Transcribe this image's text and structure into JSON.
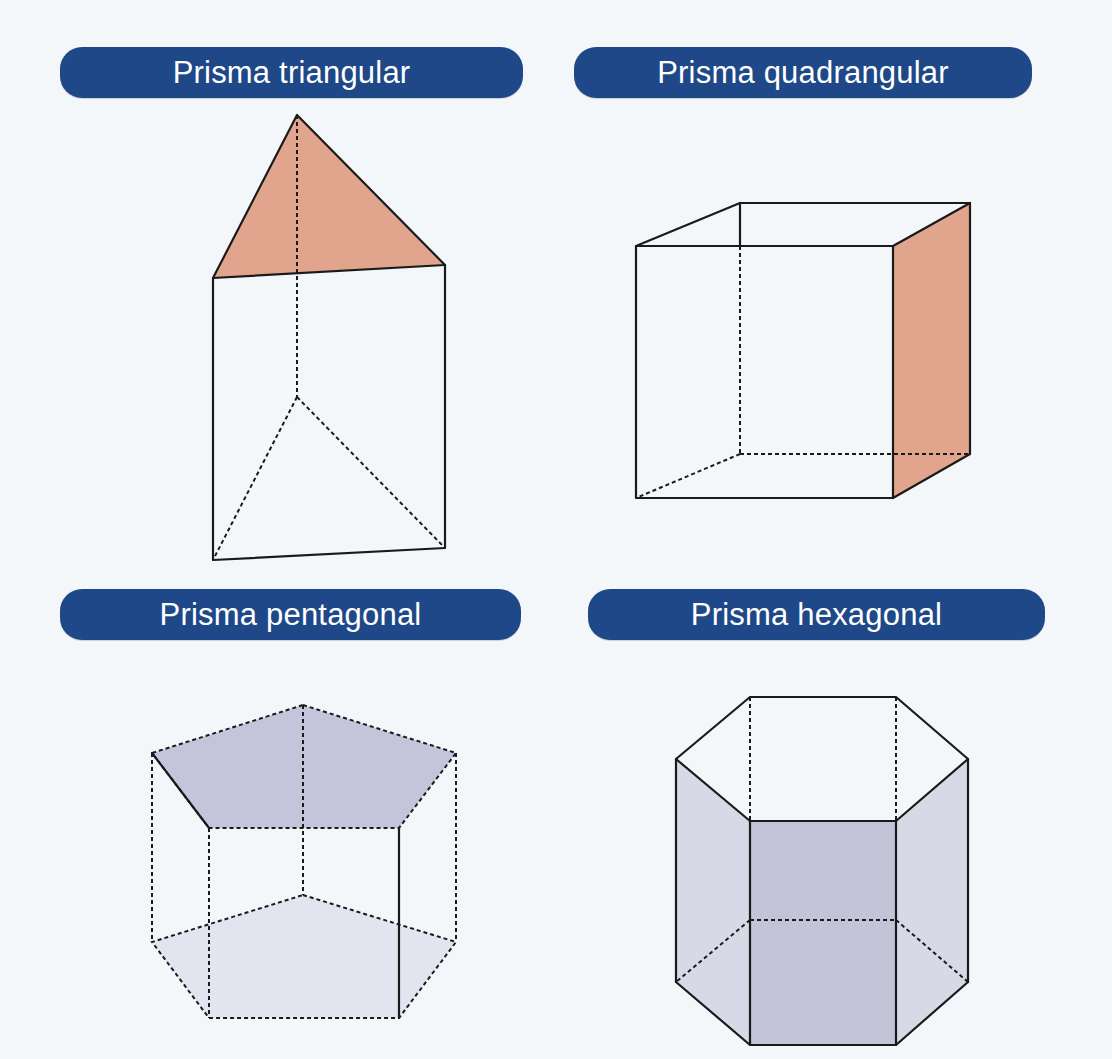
{
  "figure": {
    "panels": [
      {
        "label": "Prisma triangular",
        "shape": "triangular-prism",
        "highlighted_face": "base (top)",
        "highlight_color": "#e0a58c"
      },
      {
        "label": "Prisma quadrangular",
        "shape": "quadrangular-prism",
        "highlighted_face": "lateral face (right)",
        "highlight_color": "#e0a58c"
      },
      {
        "label": "Prisma pentagonal",
        "shape": "pentagonal-prism",
        "highlighted_face": "bases (top and bottom)",
        "highlight_color": "#c4c5da",
        "secondary_color": "#e3e4ef"
      },
      {
        "label": "Prisma hexagonal",
        "shape": "hexagonal-prism",
        "highlighted_face": "lateral faces",
        "highlight_color": "#c3c4d8",
        "secondary_color": "#d8d9e7"
      }
    ],
    "colors": {
      "background": "#f4f7fa",
      "label_pill": "#1e4888",
      "label_text": "#ffffff",
      "edge": "#1a1a1a"
    }
  }
}
